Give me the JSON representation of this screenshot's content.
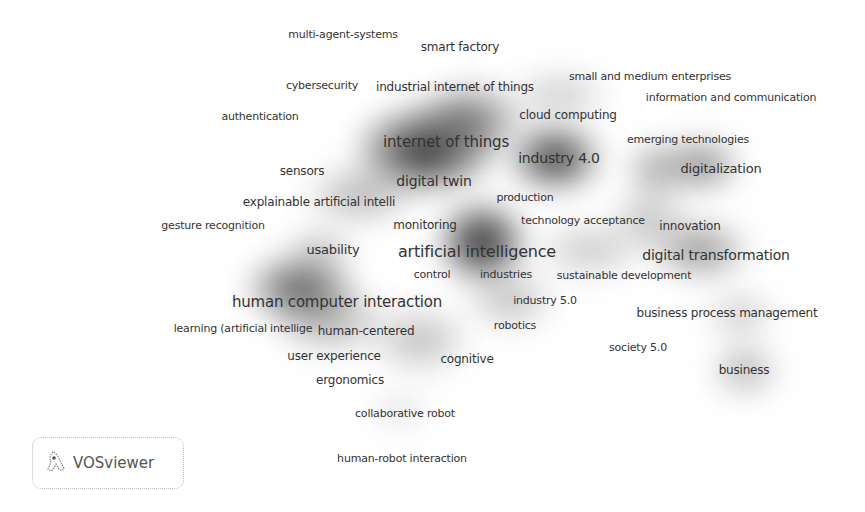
{
  "visualization": {
    "type": "density",
    "tool": "VOSviewer",
    "logo_text": "VOSviewer",
    "colors": {
      "background": "#ffffff",
      "density_dark": "#1a1a1a",
      "label": "#333333"
    }
  },
  "density_blobs": [
    {
      "x": 425,
      "y": 150,
      "rx": 70,
      "ry": 45,
      "intensity": 0.95
    },
    {
      "x": 470,
      "y": 120,
      "rx": 55,
      "ry": 38,
      "intensity": 0.6
    },
    {
      "x": 555,
      "y": 158,
      "rx": 48,
      "ry": 35,
      "intensity": 0.9
    },
    {
      "x": 482,
      "y": 242,
      "rx": 45,
      "ry": 42,
      "intensity": 1.0
    },
    {
      "x": 300,
      "y": 288,
      "rx": 55,
      "ry": 35,
      "intensity": 0.75
    },
    {
      "x": 700,
      "y": 165,
      "rx": 42,
      "ry": 28,
      "intensity": 0.55
    },
    {
      "x": 655,
      "y": 170,
      "rx": 30,
      "ry": 30,
      "intensity": 0.4
    },
    {
      "x": 700,
      "y": 250,
      "rx": 50,
      "ry": 30,
      "intensity": 0.5
    },
    {
      "x": 745,
      "y": 370,
      "rx": 35,
      "ry": 28,
      "intensity": 0.35
    },
    {
      "x": 740,
      "y": 315,
      "rx": 35,
      "ry": 25,
      "intensity": 0.25
    },
    {
      "x": 650,
      "y": 220,
      "rx": 40,
      "ry": 30,
      "intensity": 0.3
    },
    {
      "x": 330,
      "y": 320,
      "rx": 60,
      "ry": 35,
      "intensity": 0.35
    },
    {
      "x": 420,
      "y": 340,
      "rx": 50,
      "ry": 35,
      "intensity": 0.3
    },
    {
      "x": 360,
      "y": 195,
      "rx": 55,
      "ry": 30,
      "intensity": 0.35
    },
    {
      "x": 510,
      "y": 300,
      "rx": 45,
      "ry": 30,
      "intensity": 0.3
    },
    {
      "x": 590,
      "y": 250,
      "rx": 55,
      "ry": 30,
      "intensity": 0.25
    },
    {
      "x": 560,
      "y": 95,
      "rx": 50,
      "ry": 25,
      "intensity": 0.25
    },
    {
      "x": 320,
      "y": 250,
      "rx": 35,
      "ry": 22,
      "intensity": 0.3
    },
    {
      "x": 400,
      "y": 410,
      "rx": 30,
      "ry": 20,
      "intensity": 0.15
    }
  ],
  "terms": [
    {
      "text": "multi-agent-systems",
      "x": 343,
      "y": 34,
      "size": 11
    },
    {
      "text": "smart factory",
      "x": 460,
      "y": 47,
      "size": 12
    },
    {
      "text": "cybersecurity",
      "x": 322,
      "y": 85,
      "size": 11
    },
    {
      "text": "industrial internet of things",
      "x": 455,
      "y": 87,
      "size": 12
    },
    {
      "text": "small and medium enterprises",
      "x": 650,
      "y": 76,
      "size": 11
    },
    {
      "text": "information and communication",
      "x": 731,
      "y": 97,
      "size": 11
    },
    {
      "text": "authentication",
      "x": 260,
      "y": 116,
      "size": 11
    },
    {
      "text": "cloud computing",
      "x": 568,
      "y": 115,
      "size": 12
    },
    {
      "text": "emerging technologies",
      "x": 688,
      "y": 139,
      "size": 11
    },
    {
      "text": "internet of things",
      "x": 446,
      "y": 142,
      "size": 15
    },
    {
      "text": "industry 4.0",
      "x": 559,
      "y": 158,
      "size": 14
    },
    {
      "text": "digitalization",
      "x": 721,
      "y": 168,
      "size": 13
    },
    {
      "text": "sensors",
      "x": 302,
      "y": 171,
      "size": 12
    },
    {
      "text": "digital twin",
      "x": 434,
      "y": 181,
      "size": 14
    },
    {
      "text": "explainable artificial intelli",
      "x": 319,
      "y": 202,
      "size": 12
    },
    {
      "text": "production",
      "x": 525,
      "y": 197,
      "size": 11
    },
    {
      "text": "gesture recognition",
      "x": 213,
      "y": 225,
      "size": 11
    },
    {
      "text": "monitoring",
      "x": 425,
      "y": 225,
      "size": 12
    },
    {
      "text": "technology acceptance",
      "x": 583,
      "y": 220,
      "size": 11
    },
    {
      "text": "innovation",
      "x": 690,
      "y": 226,
      "size": 12
    },
    {
      "text": "usability",
      "x": 333,
      "y": 249,
      "size": 13
    },
    {
      "text": "artificial intelligence",
      "x": 477,
      "y": 252,
      "size": 16
    },
    {
      "text": "digital transformation",
      "x": 716,
      "y": 255,
      "size": 14
    },
    {
      "text": "control",
      "x": 432,
      "y": 274,
      "size": 11
    },
    {
      "text": "industries",
      "x": 506,
      "y": 274,
      "size": 11
    },
    {
      "text": "sustainable development",
      "x": 624,
      "y": 275,
      "size": 11
    },
    {
      "text": "human computer interaction",
      "x": 337,
      "y": 302,
      "size": 15
    },
    {
      "text": "industry 5.0",
      "x": 545,
      "y": 300,
      "size": 11
    },
    {
      "text": "business process management",
      "x": 727,
      "y": 313,
      "size": 12
    },
    {
      "text": "learning (artificial intellige",
      "x": 243,
      "y": 328,
      "size": 11
    },
    {
      "text": "human-centered",
      "x": 366,
      "y": 331,
      "size": 12
    },
    {
      "text": "robotics",
      "x": 515,
      "y": 325,
      "size": 11
    },
    {
      "text": "society 5.0",
      "x": 638,
      "y": 347,
      "size": 11
    },
    {
      "text": "user experience",
      "x": 334,
      "y": 356,
      "size": 12
    },
    {
      "text": "cognitive",
      "x": 467,
      "y": 359,
      "size": 12
    },
    {
      "text": "business",
      "x": 744,
      "y": 370,
      "size": 12
    },
    {
      "text": "ergonomics",
      "x": 350,
      "y": 380,
      "size": 12
    },
    {
      "text": "collaborative robot",
      "x": 405,
      "y": 413,
      "size": 11
    },
    {
      "text": "human-robot interaction",
      "x": 402,
      "y": 458,
      "size": 11
    }
  ]
}
